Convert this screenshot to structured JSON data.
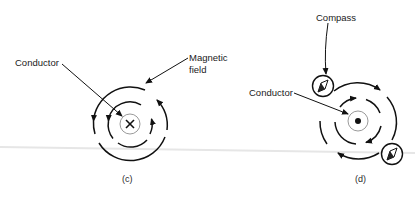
{
  "panels": [
    {
      "id": "c",
      "caption": "(c)",
      "labels": {
        "conductor": "Conductor",
        "magnetic_field_line1": "Magnetic",
        "magnetic_field_line2": "field"
      },
      "conductor_symbol": "X",
      "current_direction": "into page",
      "field_direction": "counterclockwise"
    },
    {
      "id": "d",
      "caption": "(d)",
      "labels": {
        "compass": "Compass",
        "conductor": "Conductor"
      },
      "conductor_symbol": "dot",
      "current_direction": "out of page",
      "field_direction": "clockwise",
      "compass_count": 2
    }
  ],
  "colors": {
    "stroke": "#111111",
    "conductor_ring": "#9a9a9a",
    "scan_line": "#e4e4e4"
  }
}
